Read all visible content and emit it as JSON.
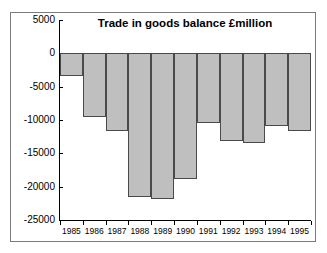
{
  "chart_data": {
    "type": "bar",
    "title": "Trade in goods balance £million",
    "xlabel": "",
    "ylabel": "",
    "categories": [
      "1985",
      "1986",
      "1987",
      "1988",
      "1989",
      "1990",
      "1991",
      "1992",
      "1993",
      "1994",
      "1995"
    ],
    "values": [
      -3400,
      -9500,
      -11600,
      -21500,
      -21800,
      -18900,
      -10400,
      -13100,
      -13500,
      -10900,
      -11700
    ],
    "ylim": [
      -25000,
      5000
    ],
    "yticks": [
      5000,
      0,
      -5000,
      -10000,
      -15000,
      -20000,
      -25000
    ],
    "ytick_labels": [
      "5000",
      "0",
      "-5000",
      "-10000",
      "-15000",
      "-20000",
      "-25000"
    ],
    "grid": false,
    "legend": null,
    "bar_color": "#bfbfbf",
    "bar_edge_color": "#4a4a4a",
    "axis_color": "#000000",
    "background_color": "#ffffff"
  }
}
